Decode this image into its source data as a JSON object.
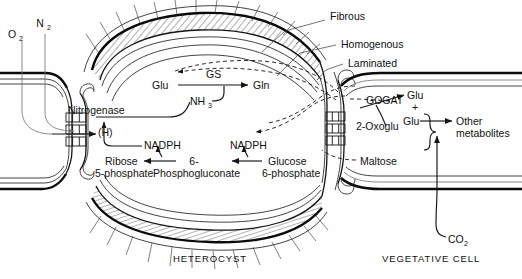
{
  "figure": {
    "background_color": "#fefefe",
    "ink_color": "#141414"
  },
  "cell_names": {
    "heterocyst": "HETEROCYST",
    "vegetative": "VEGETATIVE CELL"
  },
  "envelope_labels": {
    "fibrous": "Fibrous",
    "homogenous": "Homogenous",
    "laminated": "Laminated"
  },
  "gases": {
    "oxygen": "O",
    "oxygen_sub": "2",
    "nitrogen": "N",
    "nitrogen_sub": "2",
    "carbon_dioxide": "CO",
    "carbon_dioxide_sub": "2"
  },
  "heterocyst_pathway": {
    "enzyme_nitrogenase": "Nitrogenase",
    "reductant": "(H)",
    "ammonia": "NH",
    "ammonia_sub": "3",
    "glutamate": "Glu",
    "gs_enzyme": "GS",
    "glutamine": "Gln",
    "nadph_left": "NADPH",
    "nadph_right": "NADPH",
    "ribose": "Ribose",
    "ribose_line2": "5-phosphate",
    "six": "6-",
    "phosphogluconate": "Phosphogluconate",
    "glucose": "Glucose",
    "glucose_line2": "6-phosphate"
  },
  "vegetative_pathway": {
    "gogat_enzyme": "GOGAT",
    "glutamate_top": "Glu",
    "plus": "+",
    "glutamate_bottom": "Glu",
    "other": "Other",
    "metabolites": "metabolites",
    "oxoglutarate": "2-Oxoglu",
    "maltose": "Maltose"
  }
}
